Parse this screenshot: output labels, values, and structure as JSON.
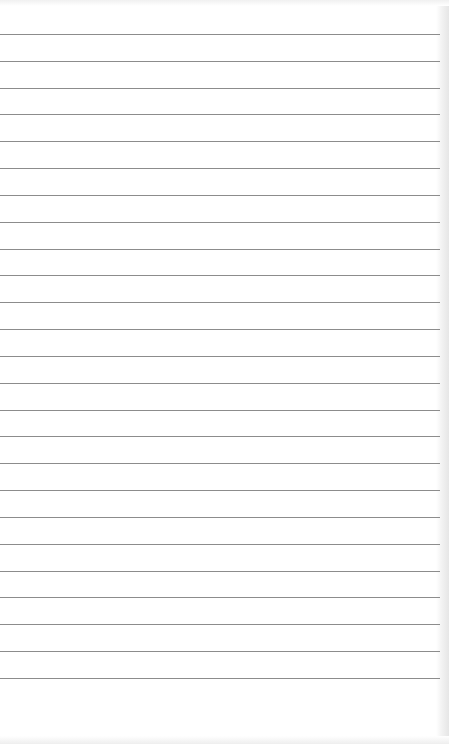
{
  "paper": {
    "type": "lined notebook paper",
    "background_color": "#ffffff",
    "line_color": "#8c8c8c",
    "line_count": 25,
    "first_line_y": 34,
    "line_spacing": 26.83,
    "line_width": 440
  }
}
